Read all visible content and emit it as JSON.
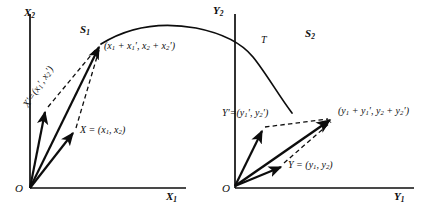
{
  "figure": {
    "ink_color": "#0d0d0d",
    "background_color": "#ffffff"
  },
  "panels": [
    {
      "id": "left",
      "region_label": "S",
      "region_sub": "1",
      "origin_label": "O",
      "axis_x_label": "X",
      "axis_x_sub": "1",
      "axis_y_label": "X",
      "axis_y_sub": "2",
      "vectors": [
        {
          "name": "x-prime-vector",
          "label_main": "X′=(",
          "label_var": "x",
          "label_sub1": "1",
          "label_mid": "′, ",
          "label_var2": "x",
          "label_sub2": "2",
          "label_end": "′)",
          "full_text": "X′=(x′1, x′2)",
          "style": "solid"
        },
        {
          "name": "x-vector",
          "full_text": "X = (x1, x2)",
          "label_head": "X = (",
          "label_var": "x",
          "label_sub1": "1",
          "label_mid": ", ",
          "label_var2": "x",
          "label_sub2": "2",
          "label_end": ")",
          "style": "solid"
        },
        {
          "name": "x-sum-vector",
          "full_text": "(x1 + x′1, x2 + x′2)",
          "label_open": "(",
          "v1": "x",
          "s1": "1",
          "plus": " + ",
          "v2": "x",
          "s2": "1",
          "p2": "′, ",
          "v3": "x",
          "s3": "2",
          "plus2": " + ",
          "v4": "x",
          "s4": "2",
          "close": "′)",
          "style": "solid"
        }
      ]
    },
    {
      "id": "right",
      "region_label": "S",
      "region_sub": "2",
      "origin_label": "O",
      "axis_x_label": "Y",
      "axis_x_sub": "1",
      "axis_y_label": "Y",
      "axis_y_sub": "2",
      "vectors": [
        {
          "name": "y-prime-vector",
          "full_text": "Y′=(y′1, y′2)",
          "label_head": "Y′=(",
          "label_var": "y",
          "label_sub1": "1",
          "label_mid": "′, ",
          "label_var2": "y",
          "label_sub2": "2",
          "label_end": "′)",
          "style": "solid"
        },
        {
          "name": "y-vector",
          "full_text": "Y = (y1, y2)",
          "label_head": "Y = (",
          "label_var": "y",
          "label_sub1": "1",
          "label_mid": ", ",
          "label_var2": "y",
          "label_sub2": "2",
          "label_end": ")",
          "style": "solid"
        },
        {
          "name": "y-sum-vector",
          "full_text": "(y1 + y′1, y2 + y′2)",
          "label_open": "(",
          "v1": "y",
          "s1": "1",
          "plus": " + ",
          "v2": "y",
          "s2": "1",
          "p2": "′, ",
          "v3": "y",
          "s3": "2",
          "plus2": " + ",
          "v4": "y",
          "s4": "2",
          "close": "′)",
          "style": "solid"
        }
      ]
    }
  ],
  "curve": {
    "name": "transformation-curve",
    "label": "T",
    "style": "solid",
    "description": "continuous concave curve running from the left panel sum point up over the top and down across the right panel to its sum point"
  }
}
